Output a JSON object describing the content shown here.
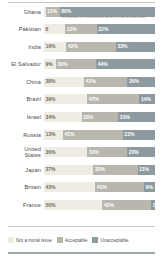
{
  "footnote": "*% of people in Ghana believe divorce is not a moral issue",
  "legend": {
    "items": [
      {
        "label": "Not a moral issue",
        "color": "#efece4",
        "icon": "legend-swatch"
      },
      {
        "label": "Acceptable",
        "color": "#b9b6ae",
        "icon": "legend-swatch"
      },
      {
        "label": "Unacceptable",
        "color": "#8d9aa0",
        "icon": "legend-swatch"
      }
    ]
  },
  "chart_data": {
    "type": "bar",
    "title": "",
    "subtitle": "",
    "xlabel": "",
    "ylabel": "",
    "orientation": "horizontal",
    "stacked": true,
    "xlim": [
      0,
      100
    ],
    "grid": false,
    "legend_position": "bottom",
    "categories": [
      "Ghana",
      "Pakistan",
      "India",
      "El Salvador",
      "China",
      "Brazil",
      "Israel",
      "Russia",
      "United States",
      "Japan",
      "Britain",
      "France"
    ],
    "series": [
      {
        "name": "Not a moral issue",
        "color": "#efece4",
        "values": [
          1,
          8,
          19,
          9,
          38,
          39,
          34,
          13,
          36,
          37,
          43,
          50
        ]
      },
      {
        "name": "Acceptable",
        "color": "#b9b6ae",
        "values": [
          12,
          12,
          42,
          30,
          41,
          47,
          33,
          41,
          33,
          33,
          41,
          42
        ]
      },
      {
        "name": "Unacceptable",
        "color": "#8d9aa0",
        "values": [
          80,
          22,
          33,
          44,
          26,
          14,
          33,
          22,
          23,
          13,
          9,
          3
        ]
      }
    ],
    "rows": [
      {
        "label": "Ghana",
        "segments": [
          {
            "series": "Not a moral issue",
            "value": 1,
            "display": "1%"
          },
          {
            "series": "Acceptable",
            "value": 12,
            "display": "12%"
          },
          {
            "series": "Unacceptable",
            "value": 80,
            "display": "80%"
          }
        ]
      },
      {
        "label": "Pakistan",
        "segments": [
          {
            "series": "Not a moral issue",
            "value": 8,
            "display": "8"
          },
          {
            "series": "Acceptable",
            "value": 12,
            "display": "12%"
          },
          {
            "series": "Unacceptable",
            "value": 22,
            "display": "22%"
          }
        ]
      },
      {
        "label": "India",
        "segments": [
          {
            "series": "Not a moral issue",
            "value": 19,
            "display": "19%"
          },
          {
            "series": "Acceptable",
            "value": 42,
            "display": "42%"
          },
          {
            "series": "Unacceptable",
            "value": 33,
            "display": "33%"
          }
        ]
      },
      {
        "label": "El Salvador",
        "segments": [
          {
            "series": "Not a moral issue",
            "value": 9,
            "display": "9%"
          },
          {
            "series": "Acceptable",
            "value": 30,
            "display": "30%"
          },
          {
            "series": "Unacceptable",
            "value": 44,
            "display": "44%"
          }
        ]
      },
      {
        "label": "China",
        "segments": [
          {
            "series": "Not a moral issue",
            "value": 38,
            "display": "38%"
          },
          {
            "series": "Acceptable",
            "value": 41,
            "display": "41%"
          },
          {
            "series": "Unacceptable",
            "value": 26,
            "display": "26%"
          }
        ]
      },
      {
        "label": "Brazil",
        "segments": [
          {
            "series": "Not a moral issue",
            "value": 39,
            "display": "39%"
          },
          {
            "series": "Acceptable",
            "value": 47,
            "display": "47%"
          },
          {
            "series": "Unacceptable",
            "value": 14,
            "display": "14%"
          }
        ]
      },
      {
        "label": "Israel",
        "segments": [
          {
            "series": "Not a moral issue",
            "value": 34,
            "display": "34%"
          },
          {
            "series": "Acceptable",
            "value": 33,
            "display": "33%"
          },
          {
            "series": "Unacceptable",
            "value": 33,
            "display": "33%"
          }
        ]
      },
      {
        "label": "Russia",
        "segments": [
          {
            "series": "Not a moral issue",
            "value": 13,
            "display": "13%"
          },
          {
            "series": "Acceptable",
            "value": 41,
            "display": "41%"
          },
          {
            "series": "Unacceptable",
            "value": 22,
            "display": "22%"
          }
        ]
      },
      {
        "label": "United\nStates",
        "segments": [
          {
            "series": "Not a moral issue",
            "value": 36,
            "display": "36%"
          },
          {
            "series": "Acceptable",
            "value": 33,
            "display": "33%"
          },
          {
            "series": "Unacceptable",
            "value": 23,
            "display": "23%"
          }
        ]
      },
      {
        "label": "Japan",
        "segments": [
          {
            "series": "Not a moral issue",
            "value": 37,
            "display": "37%"
          },
          {
            "series": "Acceptable",
            "value": 33,
            "display": "33%"
          },
          {
            "series": "Unacceptable",
            "value": 13,
            "display": "13%"
          }
        ]
      },
      {
        "label": "Britain",
        "segments": [
          {
            "series": "Not a moral issue",
            "value": 43,
            "display": "43%"
          },
          {
            "series": "Acceptable",
            "value": 41,
            "display": "41%"
          },
          {
            "series": "Unacceptable",
            "value": 9,
            "display": "9%"
          }
        ]
      },
      {
        "label": "France",
        "segments": [
          {
            "series": "Not a moral issue",
            "value": 50,
            "display": "50%"
          },
          {
            "series": "Acceptable",
            "value": 42,
            "display": "42%"
          },
          {
            "series": "Unacceptable",
            "value": 3,
            "display": "3"
          }
        ]
      }
    ]
  }
}
